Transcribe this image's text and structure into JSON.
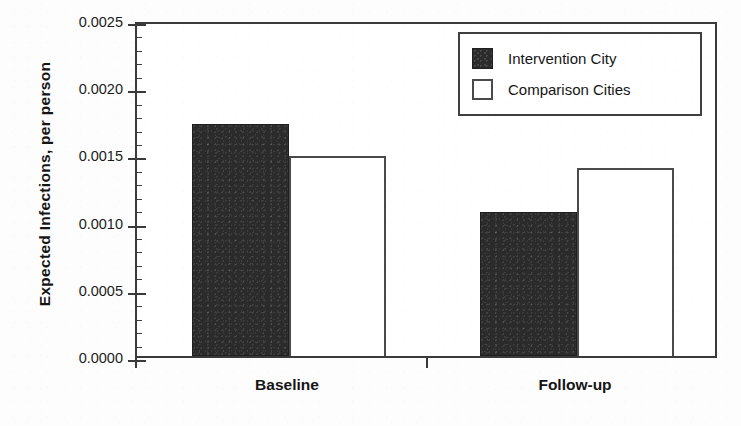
{
  "chart_data": {
    "type": "bar",
    "title": "",
    "subtitle": "",
    "xlabel": "",
    "ylabel": "Expected Infections,  per person",
    "categories": [
      "Baseline",
      "Follow-up"
    ],
    "series": [
      {
        "name": "Intervention City",
        "values": [
          0.00173,
          0.00107
        ],
        "style": "filled-dark"
      },
      {
        "name": "Comparison Cities",
        "values": [
          0.00149,
          0.0014
        ],
        "style": "open-white"
      }
    ],
    "ylim": [
      0.0,
      0.0025
    ],
    "ytick_values": [
      0.0,
      0.0005,
      0.001,
      0.0015,
      0.002,
      0.0025
    ],
    "ytick_labels": [
      "0.0000",
      "0.0005",
      "0.0010",
      "0.0015",
      "0.0020",
      "0.0025"
    ],
    "minor_ticks_per_interval": 4,
    "grid": false,
    "legend_position": "top-right",
    "bar_grouping": "adjacent-pairs",
    "colors": {
      "series_intervention": "#2b2b2b",
      "series_comparison": "#ffffff",
      "axis": "#3a3a3a",
      "text": "#151515",
      "background": "#ffffff"
    }
  },
  "legend": {
    "items": [
      {
        "label": "Intervention City"
      },
      {
        "label": "Comparison Cities"
      }
    ]
  }
}
